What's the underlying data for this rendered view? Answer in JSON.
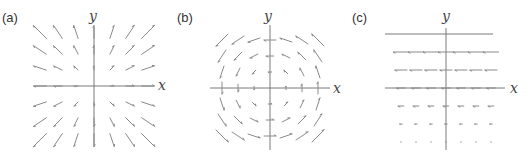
{
  "figure": {
    "panels": [
      {
        "label": "(a)",
        "x_axis_label": "x",
        "y_axis_label": "y",
        "field": "radial-outward"
      },
      {
        "label": "(b)",
        "x_axis_label": "x",
        "y_axis_label": "y",
        "field": "rotational"
      },
      {
        "label": "(c)",
        "x_axis_label": "x",
        "y_axis_label": "y",
        "field": "horizontal-leftward-increasing-with-y"
      }
    ],
    "colors": {
      "arrow": "#8a8a8a",
      "axis": "#7a7a7a",
      "text": "#333333"
    }
  }
}
